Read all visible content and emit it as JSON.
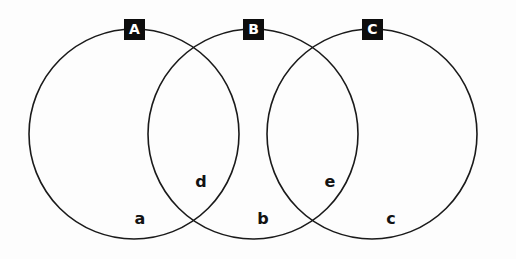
{
  "diagram": {
    "type": "venn-diagram",
    "background_color": "#fdfdfd",
    "stroke_color": "#1a1a1a",
    "badge_background_color": "#0d0d0d",
    "badge_text_color": "#ffffff",
    "label_text_color": "#131313",
    "sets": [
      {
        "id": "A",
        "label": "A",
        "center_x": 134,
        "center_y": 134,
        "radius": 105
      },
      {
        "id": "B",
        "label": "B",
        "center_x": 253,
        "center_y": 134,
        "radius": 105
      },
      {
        "id": "C",
        "label": "C",
        "center_x": 372,
        "center_y": 134,
        "radius": 105
      }
    ],
    "badges": [
      {
        "label": "A",
        "x": 124,
        "y": 19
      },
      {
        "label": "B",
        "x": 243,
        "y": 19
      },
      {
        "label": "C",
        "x": 362,
        "y": 19
      }
    ],
    "regions": [
      {
        "label": "a",
        "x": 130,
        "y": 211,
        "describes": "A only"
      },
      {
        "label": "d",
        "x": 191,
        "y": 174,
        "describes": "A and B"
      },
      {
        "label": "b",
        "x": 253,
        "y": 211,
        "describes": "B only"
      },
      {
        "label": "e",
        "x": 320,
        "y": 174,
        "describes": "B and C"
      },
      {
        "label": "c",
        "x": 381,
        "y": 211,
        "describes": "C only"
      }
    ]
  }
}
